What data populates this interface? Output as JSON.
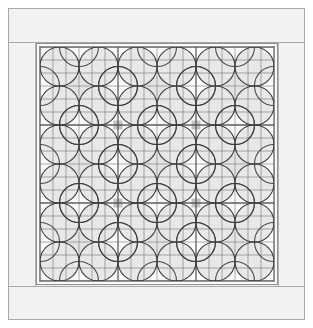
{
  "canvas": {
    "width": 313,
    "height": 328,
    "background": "#ffffff"
  },
  "artwork": {
    "title": "Geometric Tile Rosette Panel",
    "description": "Square architectural panel drawing: an outer stone frame enclosing a gridded field filled with a three-by-three array of interlaced circle rosettes.",
    "style": "line-drawing"
  },
  "palette": {
    "page_background": "#ffffff",
    "frame_fill": "#f2f2f2",
    "frame_stroke": "#a8a8a8",
    "panel_fill": "#fafafa",
    "panel_stroke": "#8f8f8f",
    "field_fill": "#fbfbfb",
    "grid_line_minor": "#6e6e6e",
    "grid_line_major": "#555555",
    "circle_stroke": "#3b3b3b",
    "petal_fill": "#e2e2e2",
    "petal_fill_dark": "#cfcfcf",
    "accent_square": "#c2c2c2"
  },
  "frame": {
    "outer": {
      "x": 8,
      "y": 8,
      "width": 297,
      "height": 312,
      "stroke_width": 1
    },
    "band_top_divider_y": 42,
    "band_bottom_divider_y": 286
  },
  "panel": {
    "x": 36,
    "y": 43,
    "width": 242,
    "height": 242,
    "inner_inset": 3,
    "stroke_width": 1
  },
  "field": {
    "x": 40,
    "y": 47,
    "width": 234,
    "height": 234
  },
  "grid": {
    "columns": 18,
    "rows": 18,
    "cell_size": 13,
    "minor_stroke_width": 0.7,
    "major_stroke_width": 1.3,
    "major_every": 6
  },
  "motifs": {
    "rows": 3,
    "columns": 3,
    "count": 9,
    "size": 78,
    "big_circle_radius": 26,
    "small_circle_radius": 19.5,
    "stroke_width": 1.1
  },
  "accents": {
    "square_size": 9,
    "positions": [
      {
        "col": 1,
        "row": 1
      },
      {
        "col": 2,
        "row": 1
      },
      {
        "col": 1,
        "row": 2
      },
      {
        "col": 2,
        "row": 2
      }
    ]
  },
  "labels": {
    "figure_name": "rosette-panel",
    "frame_name": "outer-frame",
    "panel_name": "inner-panel",
    "field_name": "pattern-field"
  }
}
